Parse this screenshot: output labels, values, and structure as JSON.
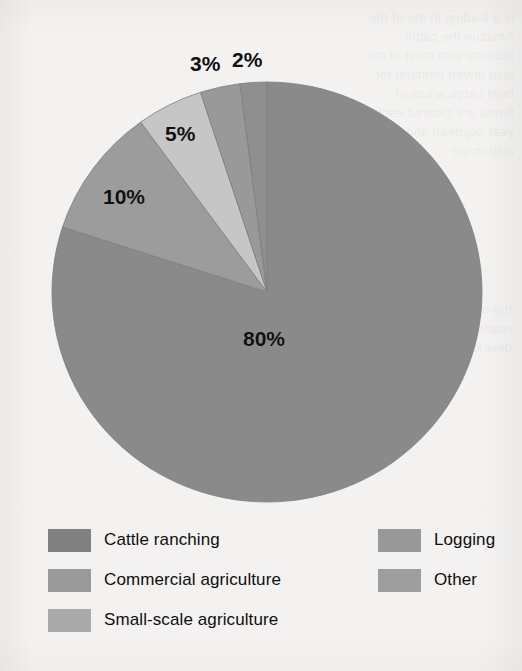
{
  "background": {
    "paper_color": "#f3f2f0",
    "ghost_text_left": "is a leading in the of the Amazon the cattle industry with most of the also driven demand for beef Large areas of forest are cleared each year soybean and are also major",
    "ghost_text_left_lower": "the of forest for logging roads and other development"
  },
  "chart_data": {
    "type": "pie",
    "title": "",
    "categories": [
      "Cattle ranching",
      "Commercial agriculture",
      "Small-scale agriculture",
      "Logging",
      "Other"
    ],
    "values": [
      80,
      10,
      5,
      3,
      2
    ],
    "value_labels": [
      "80%",
      "10%",
      "5%",
      "3%",
      "2%"
    ],
    "colors": [
      "#8a8a8a",
      "#9c9c9c",
      "#c6c6c6",
      "#999999",
      "#8f8f8f"
    ],
    "units": "percent",
    "start_angle_deg": 0,
    "direction": "counterclockwise",
    "legend_position": "bottom",
    "grid": false,
    "geometry": {
      "center_x": 267,
      "center_y": 292,
      "radius_x": 215,
      "radius_y": 210
    },
    "slices": [
      {
        "name": "Cattle ranching",
        "value": 80,
        "label": "80%",
        "color": "#8a8a8a",
        "label_x": 243,
        "label_y": 327
      },
      {
        "name": "Commercial agriculture",
        "value": 10,
        "label": "10%",
        "color": "#9c9c9c",
        "label_x": 103,
        "label_y": 185
      },
      {
        "name": "Small-scale agriculture",
        "value": 5,
        "label": "5%",
        "color": "#c6c6c6",
        "label_x": 165,
        "label_y": 122
      },
      {
        "name": "Logging",
        "value": 3,
        "label": "3%",
        "color": "#999999",
        "label_x": 190,
        "label_y": 52
      },
      {
        "name": "Other",
        "value": 2,
        "label": "2%",
        "color": "#8f8f8f",
        "label_x": 232,
        "label_y": 48
      }
    ]
  },
  "legend": {
    "columns": [
      {
        "items": [
          {
            "label": "Cattle ranching",
            "color": "#808080"
          },
          {
            "label": "Commercial agriculture",
            "color": "#9a9a9a"
          },
          {
            "label": "Small-scale agriculture",
            "color": "#aaaaaa"
          }
        ]
      },
      {
        "items": [
          {
            "label": "Logging",
            "color": "#989898"
          },
          {
            "label": "Other",
            "color": "#9e9e9e"
          }
        ]
      }
    ]
  }
}
